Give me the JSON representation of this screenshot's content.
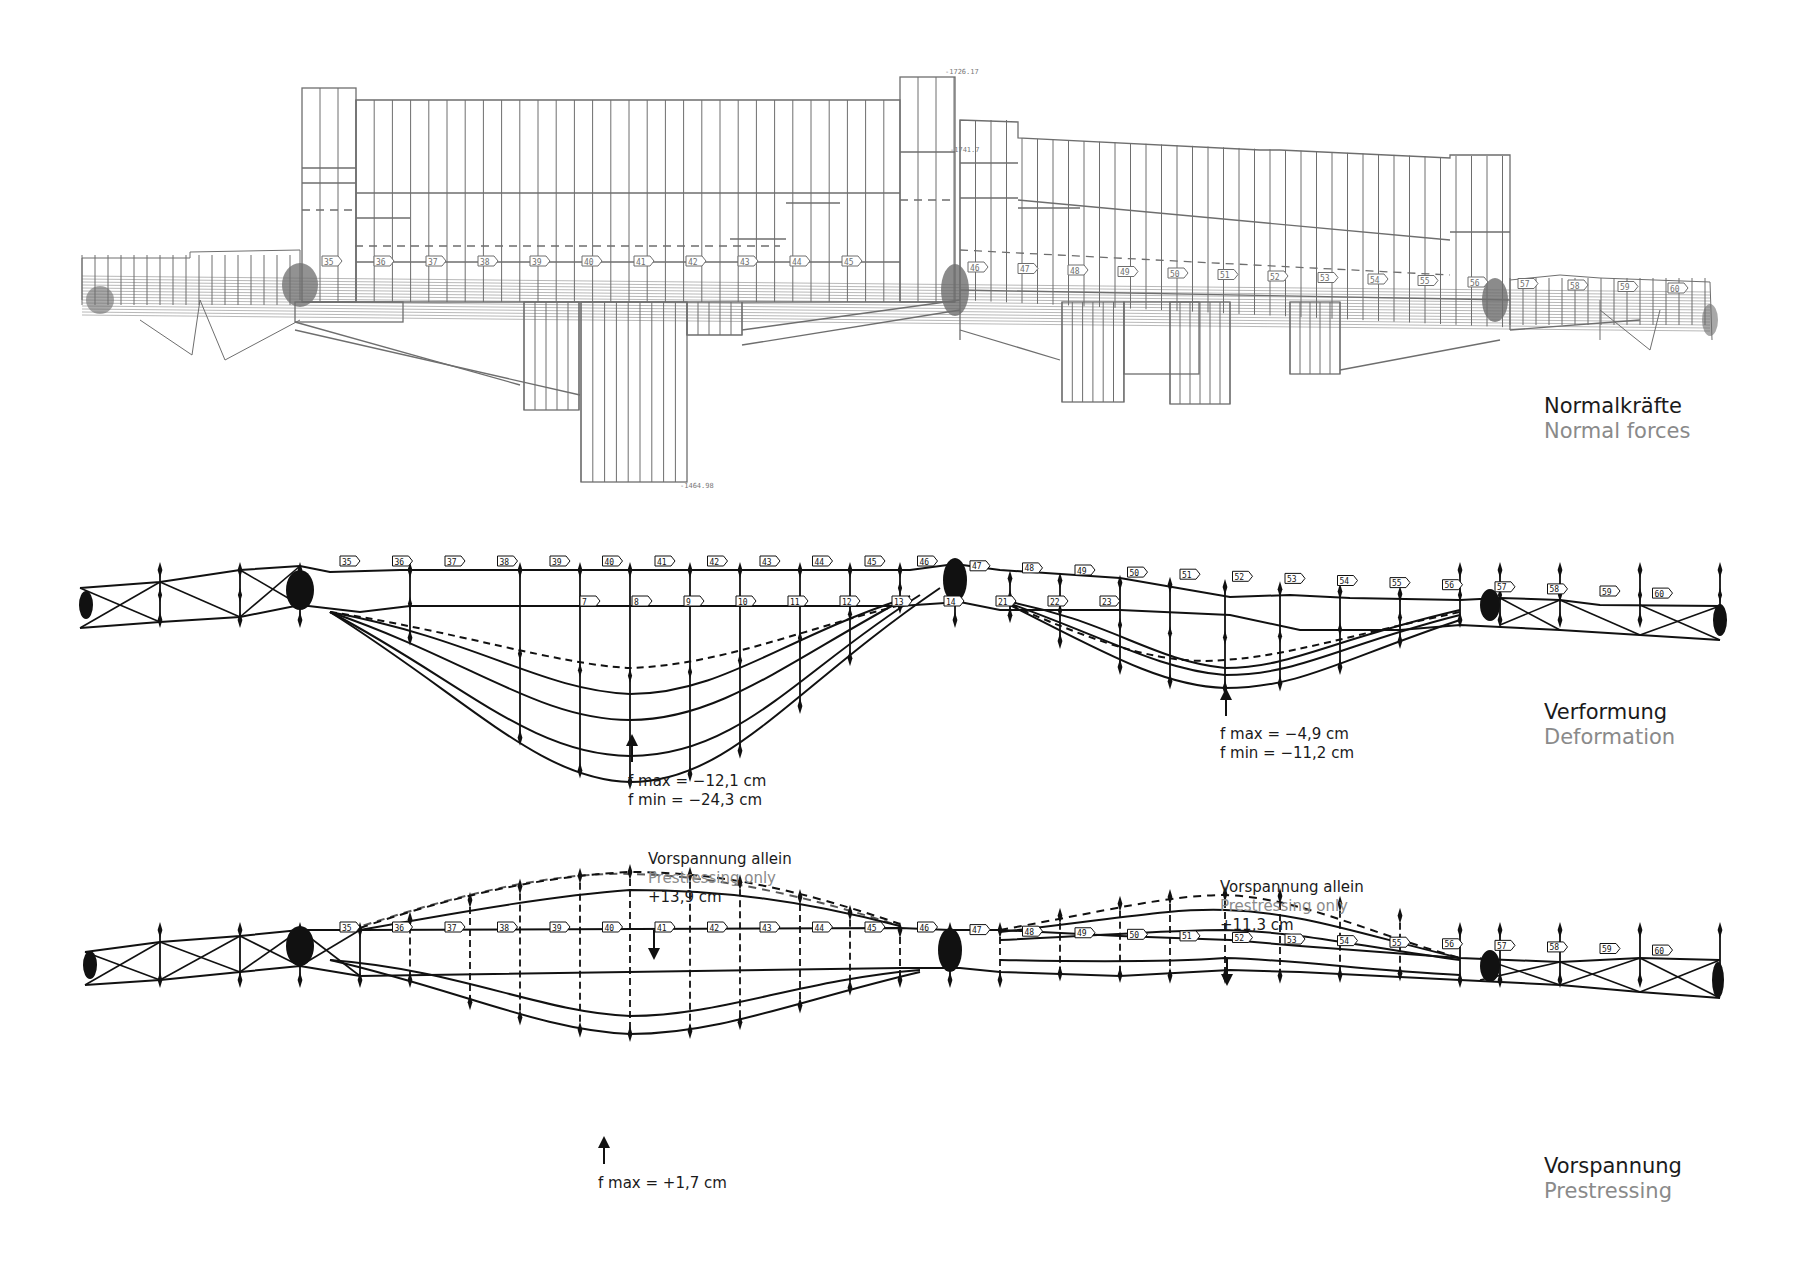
{
  "panels": [
    {
      "id": "normal-forces",
      "title_de": "Normalkräfte",
      "title_en": "Normal forces",
      "small_labels": [
        "-1726.17",
        "-1464.98",
        "-1741.7"
      ]
    },
    {
      "id": "deformation",
      "title_de": "Verformung",
      "title_en": "Deformation",
      "annotations": [
        {
          "id": "left-span",
          "lines": [
            "f max = −12,1 cm",
            "f min = −24,3 cm"
          ]
        },
        {
          "id": "right-span",
          "lines": [
            "f max = −4,9 cm",
            "f min = −11,2 cm"
          ]
        }
      ],
      "member_numbers_top": [
        "35",
        "36",
        "37",
        "38",
        "39",
        "40",
        "41",
        "42",
        "43",
        "44",
        "45",
        "46",
        "47",
        "48",
        "49",
        "50",
        "51",
        "52",
        "53",
        "54",
        "55",
        "56",
        "57",
        "58",
        "59",
        "60"
      ],
      "member_numbers_bottom": [
        "7",
        "8",
        "9",
        "10",
        "11",
        "12",
        "13",
        "14",
        "21",
        "22",
        "23"
      ]
    },
    {
      "id": "prestressing",
      "title_de": "Vorspannung",
      "title_en": "Prestressing",
      "annotations": [
        {
          "id": "left-prestress",
          "title_de": "Vorspannung allein",
          "title_en": "Prestressing only",
          "value": "+13,9 cm"
        },
        {
          "id": "right-prestress",
          "title_de": "Vorspannung allein",
          "title_en": "Prestressing only",
          "value": "+11,3 cm"
        },
        {
          "id": "left-fmax",
          "lines": [
            "f max = +1,7 cm"
          ]
        }
      ]
    }
  ],
  "colors": {
    "diagram_gray": "#6e6e6e",
    "diagram_black": "#111111",
    "caption_black": "#1a1a1a",
    "caption_gray": "#8a8a8a"
  }
}
